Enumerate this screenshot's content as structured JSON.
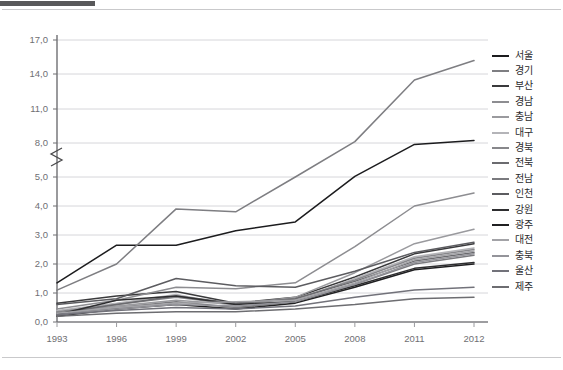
{
  "header": {
    "top_bar_color": "#58585a",
    "rule_color": "#c9c9cb"
  },
  "chart_data": {
    "type": "line",
    "title": "",
    "xlabel": "",
    "ylabel": "",
    "x": [
      1993,
      1996,
      1999,
      2002,
      2005,
      2008,
      2011,
      2012
    ],
    "xtick_labels": [
      "1993",
      "1996",
      "1999",
      "2002",
      "2005",
      "2008",
      "2011",
      "2012"
    ],
    "ytick_labels": [
      "0,0",
      "1,0",
      "2,0",
      "3,0",
      "4,0",
      "5,0",
      "8,0",
      "11,0",
      "14,0",
      "17,0"
    ],
    "ytick_values": [
      0.0,
      1.0,
      2.0,
      3.0,
      4.0,
      5.0,
      8.0,
      11.0,
      14.0,
      17.0
    ],
    "ylim": [
      0.0,
      17.0
    ],
    "axis_break": {
      "between": [
        5.0,
        8.0
      ],
      "marker": "zigzag"
    },
    "grid": true,
    "grid_axis": "y",
    "legend_position": "right",
    "series": [
      {
        "name": "서울",
        "color": "#1c1c1e",
        "values": [
          1.35,
          2.65,
          2.65,
          3.15,
          3.45,
          5.05,
          7.85,
          8.2
        ]
      },
      {
        "name": "경기",
        "color": "#7e7e82",
        "values": [
          1.1,
          2.0,
          3.9,
          3.8,
          5.0,
          8.1,
          13.5,
          15.2
        ]
      },
      {
        "name": "부산",
        "color": "#3a3a3c",
        "values": [
          0.65,
          0.9,
          1.05,
          0.65,
          0.85,
          1.55,
          2.35,
          2.7
        ]
      },
      {
        "name": "경남",
        "color": "#8d8d91",
        "values": [
          0.45,
          0.75,
          1.2,
          1.15,
          1.35,
          2.6,
          4.0,
          4.45
        ]
      },
      {
        "name": "충남",
        "color": "#9a9a9e",
        "values": [
          0.3,
          0.55,
          0.75,
          0.6,
          0.85,
          1.7,
          2.7,
          3.2
        ]
      },
      {
        "name": "대구",
        "color": "#b4b4b8",
        "values": [
          0.4,
          0.65,
          0.95,
          0.55,
          0.75,
          1.5,
          2.25,
          2.55
        ]
      },
      {
        "name": "경북",
        "color": "#87878b",
        "values": [
          0.35,
          0.6,
          0.85,
          0.6,
          0.8,
          1.45,
          2.2,
          2.5
        ]
      },
      {
        "name": "전북",
        "color": "#6b6b6f",
        "values": [
          0.3,
          0.6,
          0.9,
          0.65,
          0.8,
          1.4,
          2.1,
          2.4
        ]
      },
      {
        "name": "전남",
        "color": "#7a7a7e",
        "values": [
          0.25,
          0.5,
          0.7,
          0.5,
          0.7,
          1.3,
          2.0,
          2.3
        ]
      },
      {
        "name": "인천",
        "color": "#5c5c60",
        "values": [
          0.6,
          0.8,
          1.5,
          1.25,
          1.2,
          1.75,
          2.4,
          2.75
        ]
      },
      {
        "name": "강원",
        "color": "#2e2e30",
        "values": [
          0.25,
          0.75,
          0.9,
          0.6,
          0.7,
          1.25,
          1.85,
          2.05
        ]
      },
      {
        "name": "광주",
        "color": "#202022",
        "values": [
          0.2,
          0.45,
          0.6,
          0.45,
          0.65,
          1.2,
          1.8,
          2.0
        ]
      },
      {
        "name": "대전",
        "color": "#a3a3a7",
        "values": [
          0.3,
          0.5,
          0.65,
          0.7,
          0.75,
          1.35,
          2.15,
          2.45
        ]
      },
      {
        "name": "충북",
        "color": "#94949a",
        "values": [
          0.25,
          0.45,
          0.6,
          0.55,
          0.7,
          1.3,
          2.05,
          2.35
        ]
      },
      {
        "name": "울산",
        "color": "#72727a",
        "values": [
          0.25,
          0.4,
          0.5,
          0.45,
          0.55,
          0.85,
          1.1,
          1.2
        ]
      },
      {
        "name": "제주",
        "color": "#6d6d71",
        "values": [
          0.2,
          0.3,
          0.35,
          0.35,
          0.45,
          0.6,
          0.8,
          0.85
        ]
      }
    ]
  }
}
